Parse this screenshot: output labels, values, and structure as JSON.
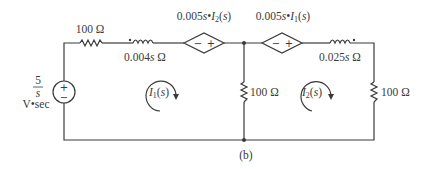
{
  "figure": {
    "caption": "(b)"
  },
  "source": {
    "numerator": "5",
    "denominator": "s",
    "units": "V•sec",
    "plus": "+",
    "minus": "−"
  },
  "top_left_resistor": {
    "label": "100 Ω"
  },
  "inductor_1": {
    "label": "0.004s Ω"
  },
  "dependent_source_1": {
    "label": "0.005s•I₂(s)",
    "minus": "−",
    "plus": "+"
  },
  "dependent_source_2": {
    "label": "0.005s•I₁(s)",
    "minus": "−",
    "plus": "+"
  },
  "inductor_2": {
    "label": "0.025s Ω"
  },
  "middle_resistor": {
    "label": "100 Ω"
  },
  "right_resistor": {
    "label": "100 Ω"
  },
  "mesh_1": {
    "label": "I₁(s)"
  },
  "mesh_2": {
    "label": "I₂(s)"
  }
}
